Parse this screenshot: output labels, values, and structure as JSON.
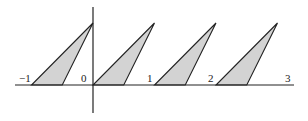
{
  "figure": {
    "type": "sawtooth-triangles-on-number-line",
    "x_axis": {
      "tick_labels": [
        "−1",
        "0",
        "1",
        "2",
        "3"
      ],
      "tick_values": [
        -1,
        0,
        1,
        2,
        3
      ],
      "range": [
        -1.25,
        3.25
      ]
    },
    "y_axis": {
      "range": [
        -0.45,
        1.25
      ],
      "tick_labels": []
    },
    "triangles": [
      {
        "base_start": -1,
        "base_end": -0.5,
        "apex": [
          0,
          1
        ]
      },
      {
        "base_start": 0,
        "base_end": 0.5,
        "apex": [
          1,
          1
        ]
      },
      {
        "base_start": 1,
        "base_end": 1.5,
        "apex": [
          2,
          1
        ]
      },
      {
        "base_start": 2,
        "base_end": 2.5,
        "apex": [
          3,
          1
        ]
      }
    ],
    "colors": {
      "fill": "#d3d3d3",
      "stroke": "#222222",
      "background": "#ffffff"
    }
  }
}
